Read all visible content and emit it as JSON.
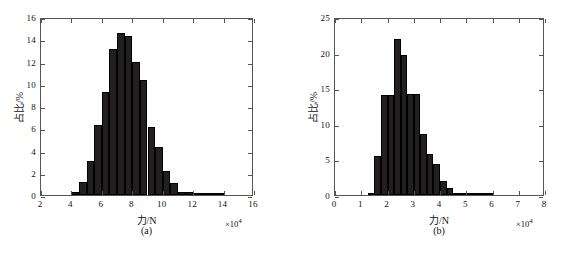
{
  "figure": {
    "background": "#ffffff",
    "bar_color": "#231f20",
    "axis_color": "#555555"
  },
  "panels": [
    {
      "id": "a",
      "caption": "(a)",
      "exponent": "×10",
      "exponent_sup": "4",
      "axis_title_x": "力/N",
      "axis_title_y": "占比/%"
    },
    {
      "id": "b",
      "caption": "(b)",
      "exponent": "×10",
      "exponent_sup": "4",
      "axis_title_x": "力/N",
      "axis_title_y": "占比/%"
    }
  ],
  "chart_data": [
    {
      "type": "bar",
      "panel": "a",
      "title": "",
      "xlabel": "力/N",
      "ylabel": "占比/%",
      "x_exponent": "×10^4",
      "xlim": [
        2,
        16
      ],
      "ylim": [
        0,
        16
      ],
      "xticks": [
        2,
        4,
        6,
        8,
        10,
        12,
        14,
        16
      ],
      "yticks": [
        0,
        2,
        4,
        6,
        8,
        10,
        12,
        14,
        16
      ],
      "xtick_labels": [
        "2",
        "4",
        "6",
        "8",
        "10",
        "12",
        "14",
        "16"
      ],
      "ytick_labels": [
        "0",
        "2",
        "4",
        "6",
        "8",
        "10",
        "12",
        "14",
        "16"
      ],
      "grid": false,
      "legend": "none",
      "bin_width": 0.5,
      "bin_starts": [
        4.0,
        4.5,
        5.0,
        5.5,
        6.0,
        6.5,
        7.0,
        7.5,
        8.0,
        8.5,
        9.0,
        9.5,
        10.0,
        10.5,
        11.0,
        11.5,
        12.0,
        12.5,
        13.0,
        13.5,
        14.0,
        14.5
      ],
      "values": [
        0.3,
        1.2,
        3.1,
        6.25,
        9.3,
        13.1,
        14.6,
        14.3,
        11.95,
        10.3,
        6.15,
        4.35,
        2.2,
        1.05,
        0.3,
        0.3,
        0.2,
        0.1,
        0.05,
        0.1,
        0.0,
        0.0
      ]
    },
    {
      "type": "bar",
      "panel": "b",
      "title": "",
      "xlabel": "力/N",
      "ylabel": "占比/%",
      "x_exponent": "×10^4",
      "xlim": [
        0,
        8
      ],
      "ylim": [
        0,
        25
      ],
      "xticks": [
        0,
        1,
        2,
        3,
        4,
        5,
        6,
        7,
        8
      ],
      "yticks": [
        0,
        5,
        10,
        15,
        20,
        25
      ],
      "xtick_labels": [
        "0",
        "1",
        "2",
        "3",
        "4",
        "5",
        "6",
        "7",
        "8"
      ],
      "ytick_labels": [
        "0",
        "5",
        "10",
        "15",
        "20",
        "25"
      ],
      "grid": false,
      "legend": "none",
      "bin_width": 0.25,
      "bin_starts": [
        1.25,
        1.5,
        1.75,
        2.0,
        2.25,
        2.5,
        2.75,
        3.0,
        3.25,
        3.5,
        3.75,
        4.0,
        4.25,
        4.5,
        4.75,
        5.0,
        5.25,
        5.5,
        5.75,
        6.0
      ],
      "values": [
        0.3,
        5.5,
        14.0,
        14.0,
        21.9,
        19.7,
        14.2,
        14.2,
        8.6,
        5.8,
        4.4,
        2.0,
        1.0,
        0.2,
        0.1,
        0.25,
        0.2,
        0.15,
        0.1,
        0.0
      ]
    }
  ]
}
